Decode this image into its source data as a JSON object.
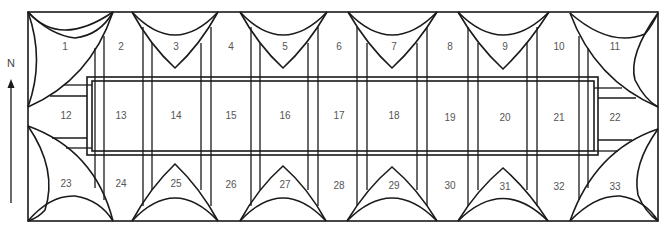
{
  "diagram": {
    "type": "floor-plan",
    "compass": {
      "label": "N",
      "direction": "up"
    },
    "colors": {
      "line": "#1a1a1a",
      "label": "#555555",
      "background": "#ffffff"
    },
    "rows": [
      {
        "name": "north-row",
        "bays": [
          "1",
          "2",
          "3",
          "4",
          "5",
          "6",
          "7",
          "8",
          "9",
          "10",
          "11"
        ]
      },
      {
        "name": "middle-row",
        "bays": [
          "12",
          "13",
          "14",
          "15",
          "16",
          "17",
          "18",
          "19",
          "20",
          "21",
          "22"
        ]
      },
      {
        "name": "south-row",
        "bays": [
          "23",
          "24",
          "25",
          "26",
          "27",
          "28",
          "29",
          "30",
          "31",
          "32",
          "33"
        ]
      }
    ],
    "labels": [
      {
        "id": "1",
        "x": 65,
        "y": 47
      },
      {
        "id": "2",
        "x": 121,
        "y": 47
      },
      {
        "id": "3",
        "x": 176,
        "y": 47
      },
      {
        "id": "4",
        "x": 231,
        "y": 47
      },
      {
        "id": "5",
        "x": 285,
        "y": 47
      },
      {
        "id": "6",
        "x": 339,
        "y": 47
      },
      {
        "id": "7",
        "x": 394,
        "y": 47
      },
      {
        "id": "8",
        "x": 450,
        "y": 47
      },
      {
        "id": "9",
        "x": 505,
        "y": 47
      },
      {
        "id": "10",
        "x": 559,
        "y": 47
      },
      {
        "id": "11",
        "x": 615,
        "y": 47
      },
      {
        "id": "12",
        "x": 66,
        "y": 116
      },
      {
        "id": "13",
        "x": 121,
        "y": 116
      },
      {
        "id": "14",
        "x": 176,
        "y": 116
      },
      {
        "id": "15",
        "x": 231,
        "y": 116
      },
      {
        "id": "16",
        "x": 285,
        "y": 116
      },
      {
        "id": "17",
        "x": 339,
        "y": 116
      },
      {
        "id": "18",
        "x": 394,
        "y": 116
      },
      {
        "id": "19",
        "x": 450,
        "y": 118
      },
      {
        "id": "20",
        "x": 505,
        "y": 118
      },
      {
        "id": "21",
        "x": 559,
        "y": 118
      },
      {
        "id": "22",
        "x": 615,
        "y": 118
      },
      {
        "id": "23",
        "x": 66,
        "y": 184
      },
      {
        "id": "24",
        "x": 121,
        "y": 184
      },
      {
        "id": "25",
        "x": 176,
        "y": 184
      },
      {
        "id": "26",
        "x": 231,
        "y": 185
      },
      {
        "id": "27",
        "x": 285,
        "y": 185
      },
      {
        "id": "28",
        "x": 339,
        "y": 186
      },
      {
        "id": "29",
        "x": 394,
        "y": 186
      },
      {
        "id": "30",
        "x": 450,
        "y": 186
      },
      {
        "id": "31",
        "x": 505,
        "y": 187
      },
      {
        "id": "32",
        "x": 559,
        "y": 187
      },
      {
        "id": "33",
        "x": 615,
        "y": 187
      }
    ]
  }
}
